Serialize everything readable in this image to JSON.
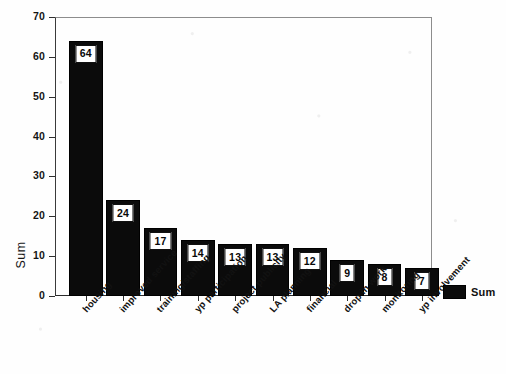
{
  "chart_data": {
    "type": "bar",
    "title": "",
    "subtitle": "",
    "xlabel": "",
    "ylabel": "Sum",
    "ylim": [
      0,
      70
    ],
    "ytick_step": 10,
    "yticks": [
      70,
      60,
      50,
      40,
      30,
      20,
      10,
      0
    ],
    "grid": false,
    "legend_position": "right",
    "categories": [
      "housing",
      "improved service",
      "training/staffing",
      "yp participation",
      "project publicity",
      "LA planning",
      "financial",
      "drop in work",
      "monitoring",
      "yp involvement"
    ],
    "values": [
      64,
      24,
      17,
      14,
      13,
      13,
      12,
      9,
      8,
      7
    ],
    "series": [
      {
        "name": "Sum",
        "color": "#0b0b0b",
        "values": [
          64,
          24,
          17,
          14,
          13,
          13,
          12,
          9,
          8,
          7
        ]
      }
    ],
    "data_labels": [
      "64",
      "24",
      "17",
      "14",
      "13",
      "13",
      "12",
      "9",
      "8",
      "7"
    ]
  },
  "legend": {
    "entries": [
      {
        "label": "Sum",
        "color": "#0b0b0b"
      }
    ]
  },
  "axis": {
    "y_title": "Sum"
  },
  "colors": {
    "bar": "#0b0b0b",
    "axis": "#2f2f2f",
    "frame": "#8d8d8d",
    "background": "#fefefe",
    "label_box_fill": "#ffffff",
    "label_text": "#080808"
  }
}
